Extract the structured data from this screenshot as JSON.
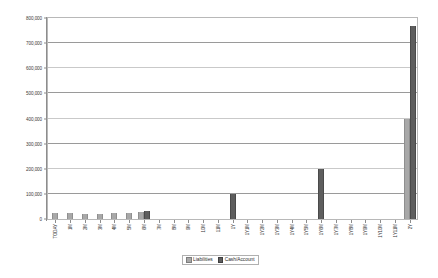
{
  "chart_data": {
    "type": "bar",
    "title": "",
    "subtitle": "",
    "xlabel": "",
    "ylabel": "",
    "ylim": [
      0,
      800000
    ],
    "ytick_step": 100000,
    "grid": true,
    "grid_axis": "y",
    "legend_position": "bottom-center",
    "orientation": "vertical",
    "categories": [
      "TODAY",
      "1M",
      "2M",
      "3M",
      "4M",
      "5M",
      "6M",
      "7M",
      "8M",
      "9M",
      "10M",
      "11M",
      "1Y",
      "1Y1M",
      "1Y2M",
      "1Y3M",
      "1Y4M",
      "1Y5M",
      "1Y6M",
      "1Y7M",
      "1Y8M",
      "1Y9M",
      "1Y10M",
      "1Y11M",
      "2Y"
    ],
    "ytick_labels": [
      "800,000",
      "700,000",
      "600,000",
      "500,000",
      "400,000",
      "300,000",
      "200,000",
      "100,000",
      "0"
    ],
    "ytick_values": [
      800000,
      700000,
      600000,
      500000,
      400000,
      300000,
      200000,
      100000,
      0
    ],
    "series": [
      {
        "name": "Liabilities",
        "color": "#a8a8a8",
        "values": [
          22000,
          22000,
          21000,
          21000,
          22000,
          22000,
          26000,
          0,
          0,
          0,
          0,
          0,
          0,
          0,
          0,
          0,
          0,
          0,
          0,
          0,
          0,
          0,
          0,
          0,
          400000
        ]
      },
      {
        "name": "Cash/Account",
        "color": "#5e5e5e",
        "values": [
          0,
          0,
          0,
          0,
          0,
          0,
          31000,
          0,
          0,
          0,
          0,
          0,
          100000,
          0,
          0,
          0,
          0,
          0,
          200000,
          0,
          0,
          0,
          0,
          0,
          770000
        ]
      }
    ]
  },
  "legend": {
    "entries": [
      {
        "label": "Liabilities"
      },
      {
        "label": "Cash/Account"
      }
    ]
  }
}
